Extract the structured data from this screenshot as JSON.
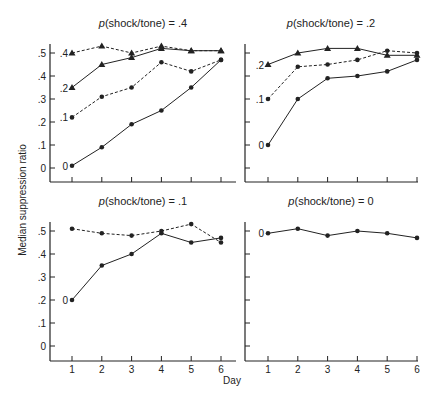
{
  "figure": {
    "ylabel": "Median suppression ratio",
    "xlabel": "Day",
    "ytick_labels": [
      ".5",
      ".4",
      ".3",
      ".2",
      ".1",
      "0"
    ],
    "xtick_labels": [
      "1",
      "2",
      "3",
      "4",
      "5",
      "6"
    ],
    "colors": {
      "ink": "#222222",
      "background": "#ffffff"
    }
  },
  "chart_data": [
    {
      "type": "line",
      "title": "p(shock/tone) = .4",
      "title_prefix": "p",
      "title_rest": "(shock/tone) = .4",
      "xlabel": "",
      "ylabel": "Median suppression ratio",
      "x": [
        1,
        2,
        3,
        4,
        5,
        6
      ],
      "ylim": [
        -0.06,
        0.53
      ],
      "show_y_tick_labels": true,
      "show_x_tick_labels": false,
      "series": [
        {
          "name": ".4",
          "style": "dashed",
          "marker": "triangle",
          "values": [
            0.5,
            0.53,
            0.5,
            0.53,
            0.51,
            0.51
          ]
        },
        {
          "name": ".2",
          "style": "solid",
          "marker": "triangle",
          "values": [
            0.35,
            0.45,
            0.48,
            0.52,
            0.51,
            0.51
          ]
        },
        {
          "name": ".1",
          "style": "dashed",
          "marker": "dot",
          "values": [
            0.22,
            0.31,
            0.35,
            0.46,
            0.42,
            0.47
          ]
        },
        {
          "name": "0",
          "style": "solid",
          "marker": "dot",
          "values": [
            0.01,
            0.09,
            0.19,
            0.25,
            0.35,
            0.47
          ]
        }
      ]
    },
    {
      "type": "line",
      "title": "p(shock/tone) = .2",
      "title_prefix": "p",
      "title_rest": "(shock/tone) = .2",
      "x": [
        1,
        2,
        3,
        4,
        5,
        6
      ],
      "ylim": [
        -0.06,
        0.53
      ],
      "show_y_tick_labels": false,
      "show_x_tick_labels": false,
      "series": [
        {
          "name": ".2",
          "style": "solid",
          "marker": "triangle",
          "values": [
            0.45,
            0.5,
            0.52,
            0.52,
            0.49,
            0.49
          ]
        },
        {
          "name": ".1",
          "style": "dashed",
          "marker": "dot",
          "values": [
            0.3,
            0.44,
            0.45,
            0.47,
            0.51,
            0.5
          ]
        },
        {
          "name": "0",
          "style": "solid",
          "marker": "dot",
          "values": [
            0.1,
            0.3,
            0.39,
            0.4,
            0.42,
            0.47
          ]
        }
      ]
    },
    {
      "type": "line",
      "title": "p(shock/tone) = .1",
      "title_prefix": "p",
      "title_rest": "(shock/tone) = .1",
      "x": [
        1,
        2,
        3,
        4,
        5,
        6
      ],
      "ylim": [
        -0.06,
        0.53
      ],
      "show_y_tick_labels": true,
      "show_x_tick_labels": true,
      "series": [
        {
          "name": "",
          "style": "dashed",
          "marker": "dot",
          "values": [
            0.51,
            0.49,
            0.48,
            0.5,
            0.53,
            0.45
          ]
        },
        {
          "name": "0",
          "style": "solid",
          "marker": "dot",
          "values": [
            0.2,
            0.35,
            0.4,
            0.49,
            0.45,
            0.47
          ]
        }
      ]
    },
    {
      "type": "line",
      "title": "p(shock/tone) = 0",
      "title_prefix": "p",
      "title_rest": "(shock/tone) = 0",
      "xlabel": "Day",
      "x": [
        1,
        2,
        3,
        4,
        5,
        6
      ],
      "ylim": [
        -0.06,
        0.53
      ],
      "show_y_tick_labels": false,
      "show_x_tick_labels": true,
      "series": [
        {
          "name": "0",
          "style": "solid",
          "marker": "dot",
          "values": [
            0.49,
            0.51,
            0.48,
            0.5,
            0.49,
            0.47
          ]
        }
      ]
    }
  ]
}
